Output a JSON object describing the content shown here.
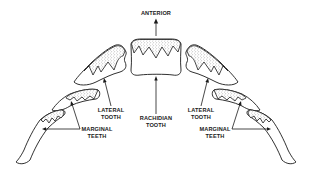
{
  "figure": {
    "labels": {
      "anterior": "ANTERIOR",
      "rachidian_line1": "RACHIDIAN",
      "rachidian_line2": "TOOTH",
      "lateral_left_line1": "LATERAL",
      "lateral_left_line2": "TOOTH",
      "lateral_right_line1": "LATERAL",
      "lateral_right_line2": "TOOTH",
      "marginal_left_line1": "MARGINAL",
      "marginal_left_line2": "TEETH",
      "marginal_right_line1": "MARGINAL",
      "marginal_right_line2": "TEETH"
    },
    "colors": {
      "ink": "#1a1a1a",
      "background": "#ffffff"
    }
  }
}
